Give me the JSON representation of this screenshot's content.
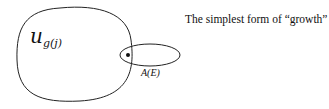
{
  "diagram": {
    "caption": "The simplest form of “growth”",
    "large_set": {
      "label_main": "u",
      "label_sub": "g(j)"
    },
    "small_set": {
      "label": "A(E)"
    },
    "point": "dot"
  },
  "colors": {
    "stroke": "#222222",
    "background": "#ffffff"
  }
}
